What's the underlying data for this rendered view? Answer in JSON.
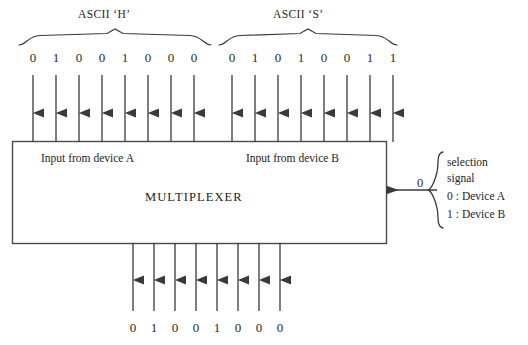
{
  "diagram": {
    "title_alt": "Multiplexer selecting between two 8-bit ASCII inputs",
    "colors": {
      "stroke": "#3a3a3a",
      "text": "#242424",
      "background": "#ffffff"
    }
  },
  "input_groups": [
    {
      "caption": "ASCII ‘H’",
      "bits": [
        "0",
        "1",
        "0",
        "0",
        "1",
        "0",
        "0",
        "0"
      ],
      "box_label": "Input from device A"
    },
    {
      "caption": "ASCII ‘S’",
      "bits": [
        "0",
        "1",
        "0",
        "1",
        "0",
        "0",
        "1",
        "1"
      ],
      "box_label": "Input from device B"
    }
  ],
  "multiplexer": {
    "title": "MULTIPLEXER"
  },
  "selection": {
    "value": "0",
    "legend": [
      {
        "text": "selection"
      },
      {
        "text": "signal"
      },
      {
        "key": "0",
        "colon": ":",
        "text": "Device A"
      },
      {
        "key": "1",
        "colon": ":",
        "text": "Device B"
      }
    ]
  },
  "output": {
    "bits": [
      "0",
      "1",
      "0",
      "0",
      "1",
      "0",
      "0",
      "0"
    ]
  }
}
